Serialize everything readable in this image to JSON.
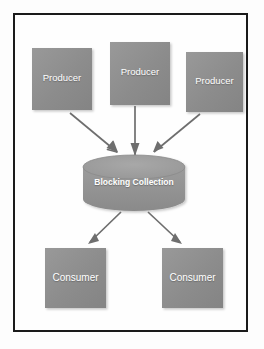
{
  "diagram": {
    "frame": {
      "border_color": "#1a1a1a",
      "background_color": "#fefefe"
    },
    "colors": {
      "node_fill": "#8c8c8c",
      "node_fill_light": "#9a9a9a",
      "node_fill_dark": "#7e7e7e",
      "cylinder_fill": "#949494",
      "cylinder_top": "#a0a0a0",
      "arrow_color": "#6e6e6e",
      "label_color": "#ffffff",
      "page_background": "#ffffff"
    },
    "producers": [
      {
        "id": "producer-1",
        "label": "Producer"
      },
      {
        "id": "producer-2",
        "label": "Producer"
      },
      {
        "id": "producer-3",
        "label": "Producer"
      }
    ],
    "collection": {
      "id": "blocking-collection",
      "label": "Blocking Collection",
      "shape": "cylinder"
    },
    "consumers": [
      {
        "id": "consumer-1",
        "label": "Consumer"
      },
      {
        "id": "consumer-2",
        "label": "Consumer"
      }
    ],
    "edges": [
      {
        "from": "producer-1",
        "to": "blocking-collection",
        "direction": "down-right"
      },
      {
        "from": "producer-2",
        "to": "blocking-collection",
        "direction": "down"
      },
      {
        "from": "producer-3",
        "to": "blocking-collection",
        "direction": "down-left"
      },
      {
        "from": "blocking-collection",
        "to": "consumer-1",
        "direction": "down-left"
      },
      {
        "from": "blocking-collection",
        "to": "consumer-2",
        "direction": "down-right"
      }
    ]
  }
}
